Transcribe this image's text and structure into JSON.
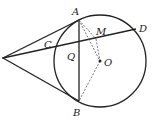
{
  "diagram": {
    "type": "geometry",
    "labels": {
      "A": "A",
      "B": "B",
      "C": "C",
      "D": "D",
      "M": "M",
      "O": "O",
      "Q": "Q",
      "P": "P"
    },
    "points": {
      "P": [
        3,
        58
      ],
      "A": [
        79,
        20
      ],
      "B": [
        79,
        101
      ],
      "C": [
        55,
        49
      ],
      "D": [
        136,
        29
      ],
      "M": [
        96,
        39
      ],
      "Q": [
        79,
        43
      ],
      "O": [
        100,
        61
      ]
    },
    "circle": {
      "center": "O",
      "radius": 46
    },
    "colors": {
      "stroke": "#222222",
      "dashed": "#555555"
    }
  }
}
